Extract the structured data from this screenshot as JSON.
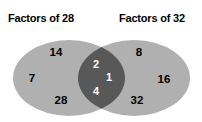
{
  "diagram": {
    "type": "venn",
    "sets": [
      {
        "id": "left",
        "label": "Factors of 28"
      },
      {
        "id": "right",
        "label": "Factors of 32"
      }
    ],
    "colors": {
      "background": "#ffffff",
      "circle_fill": "#b0b0b0",
      "intersection_fill": "#585858",
      "label_text": "#000000",
      "intersection_text": "#ffffff"
    },
    "regions": {
      "left_only": {
        "members": [
          {
            "value": "14",
            "x": 56,
            "y": 52
          },
          {
            "value": "7",
            "x": 32,
            "y": 78
          },
          {
            "value": "28",
            "x": 61,
            "y": 100
          }
        ]
      },
      "intersection": {
        "members": [
          {
            "value": "2",
            "x": 96,
            "y": 64
          },
          {
            "value": "1",
            "x": 109,
            "y": 77
          },
          {
            "value": "4",
            "x": 96,
            "y": 91
          }
        ]
      },
      "right_only": {
        "members": [
          {
            "value": "8",
            "x": 139,
            "y": 52
          },
          {
            "value": "16",
            "x": 164,
            "y": 79
          },
          {
            "value": "32",
            "x": 137,
            "y": 100
          }
        ]
      }
    }
  }
}
